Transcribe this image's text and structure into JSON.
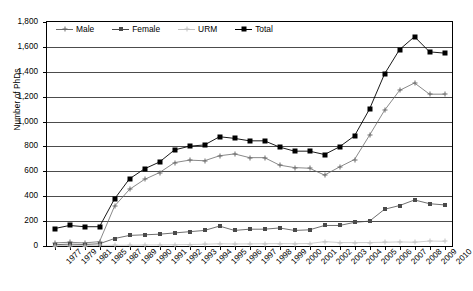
{
  "chart_data": {
    "type": "line",
    "title": "",
    "xlabel": "",
    "ylabel": "Number of PhDs",
    "ylim": [
      0,
      1800
    ],
    "ytick_step": 200,
    "grid": true,
    "legend_position": "top-inside",
    "categories": [
      "1977",
      "1979",
      "1981",
      "1985",
      "1987",
      "1989",
      "1990",
      "1991",
      "1992",
      "1993",
      "1994",
      "1995",
      "1996",
      "1997",
      "1998",
      "1999",
      "2000",
      "2001",
      "2002",
      "2003",
      "2004",
      "2005",
      "2006",
      "2007",
      "2008",
      "2009",
      "2010"
    ],
    "ytick_labels": [
      "0",
      "200",
      "400",
      "600",
      "800",
      "1,000",
      "1,200",
      "1,400",
      "1,600",
      "1,800"
    ],
    "series": [
      {
        "name": "Male",
        "color": "#6b6b6b",
        "marker": "cross",
        "values": [
          25,
          30,
          25,
          35,
          320,
          455,
          535,
          590,
          670,
          690,
          685,
          725,
          740,
          710,
          710,
          650,
          630,
          625,
          570,
          635,
          695,
          890,
          1090,
          1250,
          1310,
          1220,
          1220
        ]
      },
      {
        "name": "Female",
        "color": "#4a4a4a",
        "marker": "square-small",
        "values": [
          10,
          15,
          12,
          18,
          60,
          85,
          90,
          95,
          105,
          115,
          125,
          160,
          125,
          135,
          135,
          145,
          125,
          130,
          165,
          165,
          190,
          200,
          295,
          325,
          370,
          340,
          330
        ]
      },
      {
        "name": "URM",
        "color": "#c2c2c2",
        "marker": "cross-light",
        "values": [
          3,
          4,
          4,
          5,
          6,
          7,
          8,
          9,
          10,
          12,
          14,
          18,
          16,
          17,
          18,
          19,
          18,
          20,
          35,
          28,
          27,
          28,
          30,
          33,
          30,
          40,
          38
        ]
      },
      {
        "name": "Total",
        "color": "#000000",
        "marker": "square",
        "values": [
          140,
          165,
          155,
          155,
          378,
          540,
          620,
          675,
          772,
          802,
          812,
          878,
          865,
          845,
          845,
          795,
          762,
          762,
          735,
          797,
          885,
          1100,
          1382,
          1578,
          1682,
          1560,
          1550
        ]
      }
    ]
  }
}
